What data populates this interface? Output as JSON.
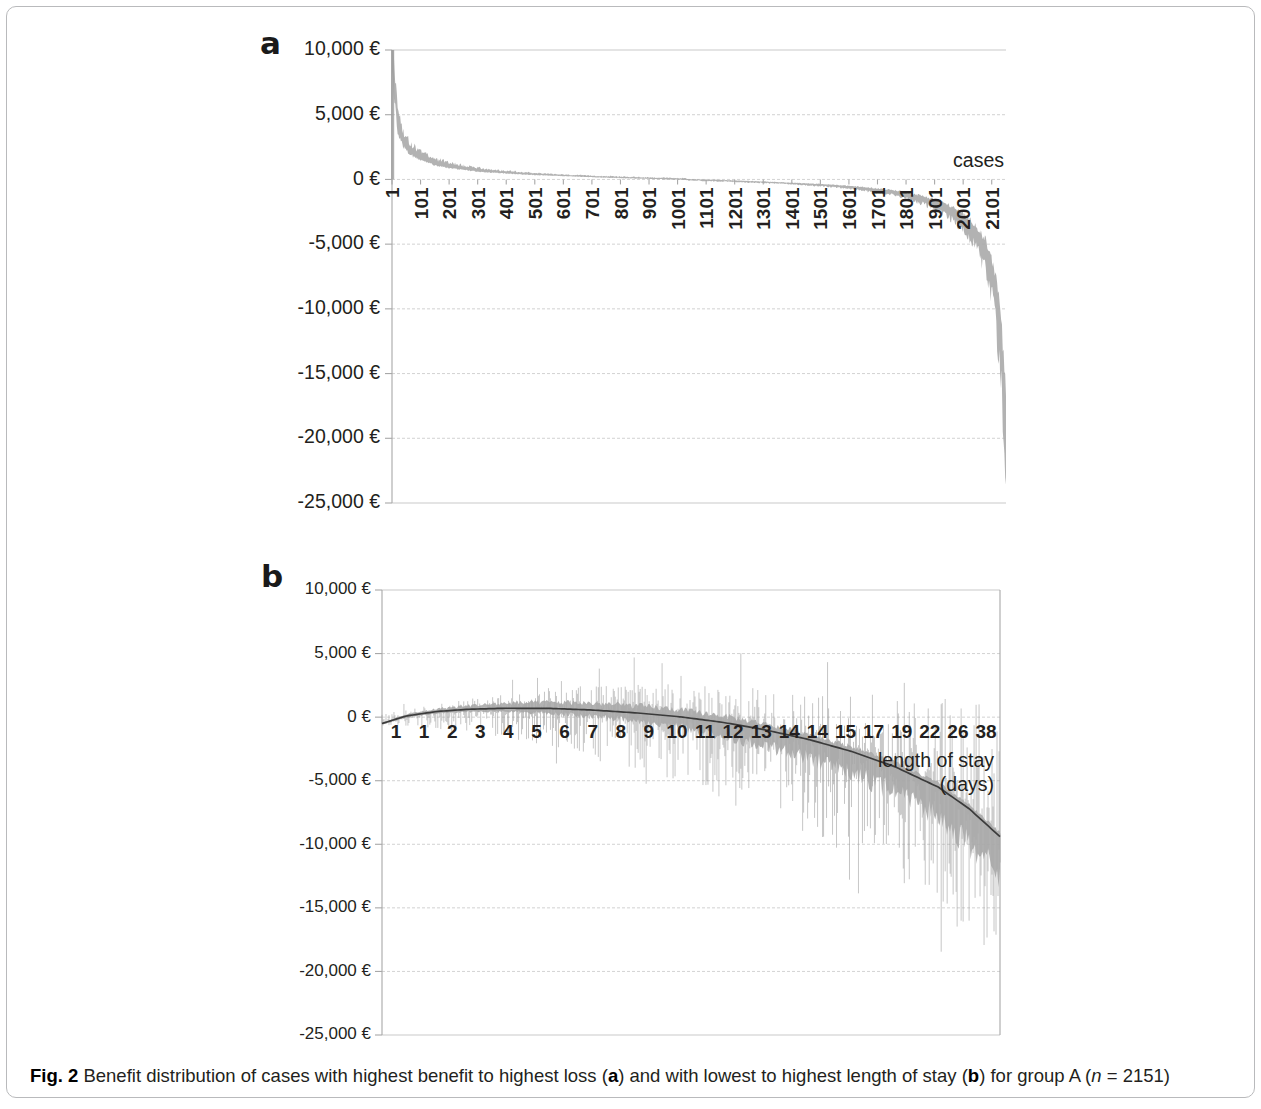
{
  "figure": {
    "caption_label": "Fig. 2",
    "caption_text_1": " Benefit distribution of cases with highest benefit to highest loss (",
    "caption_a": "a",
    "caption_text_2": ") and with lowest to highest length of stay (",
    "caption_b": "b",
    "caption_text_3": ") for group A (",
    "caption_n_italic": "n",
    "caption_text_4": " = 2151)",
    "panel_a_letter": "a",
    "panel_b_letter": "b",
    "currency_symbol": "€"
  },
  "chart_data": [
    {
      "id": "panel-a",
      "type": "area",
      "title": "",
      "panel_letter": "a",
      "xlabel": "cases",
      "ylabel": "",
      "ylim": [
        -25000,
        10000
      ],
      "xlim": [
        1,
        2151
      ],
      "grid": true,
      "legend": "none",
      "ytick_labels": [
        "10,000 €",
        "5,000 €",
        "0 €",
        "-5,000 €",
        "-10,000 €",
        "-15,000 €",
        "-20,000 €",
        "-25,000 €"
      ],
      "ytick_values": [
        10000,
        5000,
        0,
        -5000,
        -10000,
        -15000,
        -20000,
        -25000
      ],
      "xtick_labels": [
        "1",
        "101",
        "201",
        "301",
        "401",
        "501",
        "601",
        "701",
        "801",
        "901",
        "1001",
        "1101",
        "1201",
        "1301",
        "1401",
        "1501",
        "1601",
        "1701",
        "1801",
        "1901",
        "2001",
        "2101"
      ],
      "xtick_values": [
        1,
        101,
        201,
        301,
        401,
        501,
        601,
        701,
        801,
        901,
        1001,
        1101,
        1201,
        1301,
        1401,
        1501,
        1601,
        1701,
        1801,
        1901,
        2001,
        2101
      ],
      "x": [
        1,
        20,
        40,
        60,
        90,
        120,
        160,
        200,
        250,
        300,
        360,
        420,
        500,
        600,
        700,
        800,
        900,
        1000,
        1100,
        1200,
        1300,
        1400,
        1500,
        1600,
        1700,
        1780,
        1850,
        1900,
        1950,
        2000,
        2040,
        2080,
        2110,
        2130,
        2145,
        2151
      ],
      "values": [
        9700,
        4200,
        2900,
        2300,
        1800,
        1500,
        1200,
        1020,
        830,
        700,
        580,
        490,
        390,
        290,
        210,
        140,
        80,
        20,
        -40,
        -110,
        -190,
        -290,
        -400,
        -560,
        -790,
        -1020,
        -1400,
        -1750,
        -2250,
        -3000,
        -3900,
        -5400,
        -7800,
        -11000,
        -16500,
        -20000
      ],
      "note": "Cases sorted from highest benefit to highest loss; shaded band is the per-case benefit value."
    },
    {
      "id": "panel-b",
      "type": "area",
      "title": "",
      "panel_letter": "b",
      "xlabel": "length of stay",
      "xlabel_unit": "(days)",
      "ylabel": "",
      "ylim": [
        -25000,
        10000
      ],
      "grid": true,
      "legend": "none",
      "ytick_labels": [
        "10,000 €",
        "5,000 €",
        "0 €",
        "-5,000 €",
        "-10,000 €",
        "-15,000 €",
        "-20,000 €",
        "-25,000 €"
      ],
      "ytick_values": [
        10000,
        5000,
        0,
        -5000,
        -10000,
        -15000,
        -20000,
        -25000
      ],
      "xtick_labels": [
        "1",
        "1",
        "2",
        "3",
        "4",
        "5",
        "6",
        "7",
        "8",
        "9",
        "10",
        "11",
        "12",
        "13",
        "14",
        "14",
        "15",
        "17",
        "19",
        "22",
        "26",
        "38"
      ],
      "trend": {
        "name": "moving average benefit",
        "x": [
          0,
          0.04,
          0.09,
          0.14,
          0.2,
          0.27,
          0.34,
          0.41,
          0.48,
          0.55,
          0.62,
          0.69,
          0.76,
          0.83,
          0.9,
          0.95,
          1.0
        ],
        "values": [
          -500,
          100,
          450,
          620,
          700,
          690,
          560,
          340,
          40,
          -400,
          -1000,
          -1750,
          -2700,
          -3900,
          -5500,
          -7200,
          -9400
        ]
      },
      "band": {
        "name": "benefit spread per case",
        "x": [
          0,
          0.05,
          0.1,
          0.15,
          0.2,
          0.25,
          0.3,
          0.35,
          0.4,
          0.45,
          0.5,
          0.55,
          0.6,
          0.65,
          0.7,
          0.75,
          0.8,
          0.85,
          0.9,
          0.95,
          1.0
        ],
        "upper": [
          300,
          700,
          1100,
          1500,
          1900,
          2200,
          2500,
          2600,
          2700,
          2700,
          2600,
          2500,
          2400,
          2200,
          2100,
          1900,
          1800,
          1700,
          1600,
          1500,
          1400
        ],
        "lower": [
          -600,
          -800,
          -1000,
          -1300,
          -1700,
          -2200,
          -2800,
          -3500,
          -4200,
          -5000,
          -5800,
          -6700,
          -7600,
          -8600,
          -9600,
          -10800,
          -12200,
          -13800,
          -15600,
          -17800,
          -20200
        ]
      },
      "note": "Cases sorted from lowest to highest length of stay; dark curve is the trend of benefit."
    }
  ]
}
